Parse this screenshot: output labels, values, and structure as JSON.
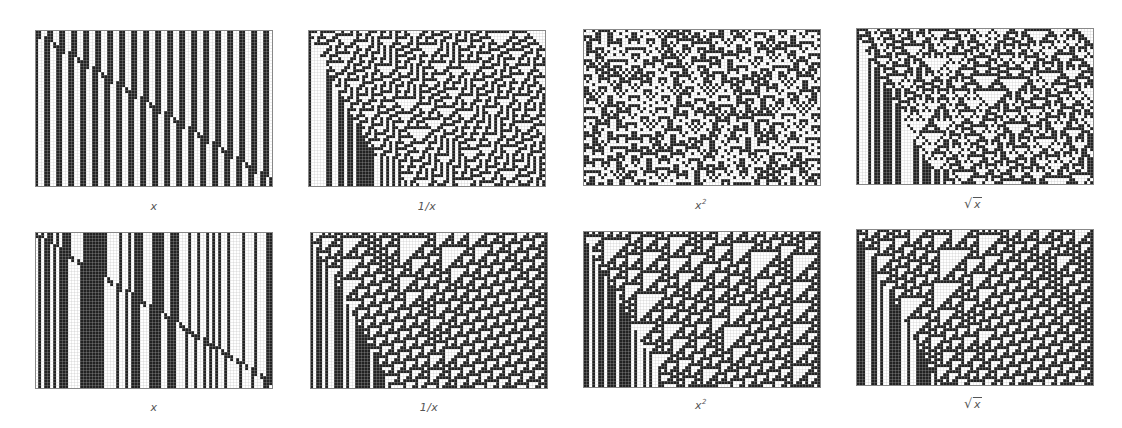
{
  "figure": {
    "grid": {
      "cols": 79,
      "rows": 52,
      "cell_px": 3,
      "on_color": "#222222",
      "off_color": "#ffffff",
      "grid_line_color": "#b8b8b8"
    },
    "rows": [
      {
        "panels": [
          {
            "id": "r1-x",
            "label": "x",
            "label_type": "plain",
            "x": 35,
            "y": 30,
            "pattern": "stripes-diagonal"
          },
          {
            "id": "r1-inv",
            "label": "1/x",
            "label_type": "plain",
            "x": 308,
            "y": 30,
            "pattern": "complex-corner"
          },
          {
            "id": "r1-sq",
            "label": "x",
            "label_sup": "2",
            "label_type": "power",
            "x": 583,
            "y": 29,
            "pattern": "columns-complex"
          },
          {
            "id": "r1-sqrt",
            "label": "x",
            "label_type": "sqrt",
            "x": 856,
            "y": 28,
            "pattern": "complex-corner"
          }
        ],
        "label_y": 200
      },
      {
        "panels": [
          {
            "id": "r2-x",
            "label": "x",
            "label_type": "plain",
            "x": 35,
            "y": 232,
            "pattern": "stripes-diagonal-2"
          },
          {
            "id": "r2-inv",
            "label": "1/x",
            "label_type": "plain",
            "x": 310,
            "y": 232,
            "pattern": "complex-corner"
          },
          {
            "id": "r2-sq",
            "label": "x",
            "label_sup": "2",
            "label_type": "power",
            "x": 583,
            "y": 231,
            "pattern": "complex-corner"
          },
          {
            "id": "r2-sqrt",
            "label": "x",
            "label_type": "sqrt",
            "x": 856,
            "y": 229,
            "pattern": "complex-corner"
          }
        ],
        "label_y": 401
      }
    ]
  }
}
